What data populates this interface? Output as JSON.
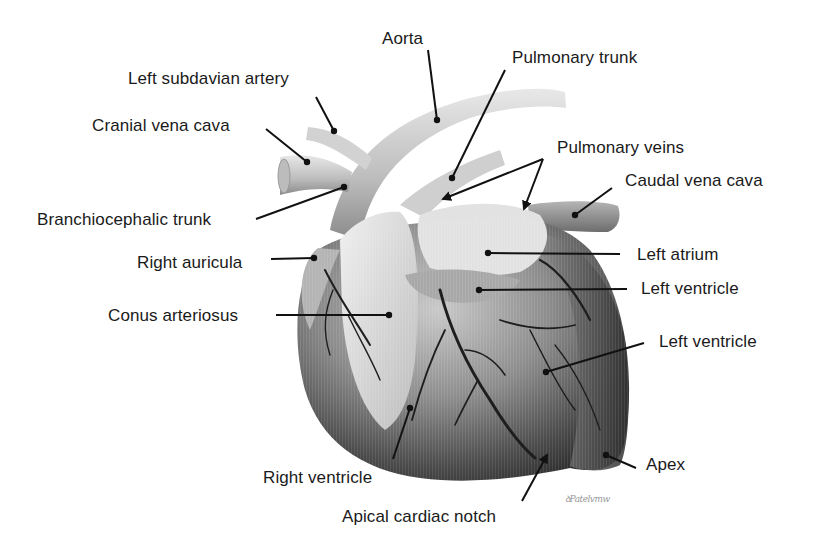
{
  "figure": {
    "colors": {
      "background": "#ffffff",
      "text": "#1a1a1a",
      "leader": "#111111"
    },
    "signature": "ꝺPatelvmw"
  },
  "labels": [
    {
      "id": "aorta",
      "text": "Aorta",
      "x": 382,
      "y": 30,
      "align": "left",
      "line": [
        [
          428,
          50
        ],
        [
          437,
          120
        ]
      ],
      "dot": true
    },
    {
      "id": "pulmonary-trunk",
      "text": "Pulmonary trunk",
      "x": 512,
      "y": 49,
      "align": "left",
      "line": [
        [
          505,
          70
        ],
        [
          452,
          178
        ]
      ],
      "dot": true
    },
    {
      "id": "left-subclavian-artery",
      "text": "Left subdavian artery",
      "x": 128,
      "y": 70,
      "align": "left",
      "line": [
        [
          316,
          97
        ],
        [
          334,
          131
        ]
      ],
      "dot": true
    },
    {
      "id": "cranial-vena-cava",
      "text": "Cranial vena cava",
      "x": 92,
      "y": 117,
      "align": "left",
      "line": [
        [
          266,
          129
        ],
        [
          307,
          162
        ]
      ],
      "dot": true
    },
    {
      "id": "pulmonary-veins",
      "text": "Pulmonary veins",
      "x": 557,
      "y": 139,
      "align": "left",
      "line": [
        [
          543,
          159
        ],
        [
          443,
          199
        ]
      ],
      "line2": [
        [
          543,
          159
        ],
        [
          524,
          209
        ]
      ],
      "arrow": true
    },
    {
      "id": "caudal-vena-cava",
      "text": "Caudal vena cava",
      "x": 625,
      "y": 172,
      "align": "left",
      "line": [
        [
          612,
          188
        ],
        [
          575,
          215
        ]
      ],
      "dot": true
    },
    {
      "id": "branchiocephalic-trunk",
      "text": "Branchiocephalic trunk",
      "x": 37,
      "y": 211,
      "align": "left",
      "line": [
        [
          256,
          219
        ],
        [
          344,
          187
        ]
      ],
      "dot": true
    },
    {
      "id": "left-atrium",
      "text": "Left atrium",
      "x": 637,
      "y": 246,
      "align": "left",
      "line": [
        [
          620,
          254
        ],
        [
          488,
          253
        ]
      ],
      "dot": true
    },
    {
      "id": "right-auricula",
      "text": "Right auricula",
      "x": 137,
      "y": 254,
      "align": "left",
      "line": [
        [
          271,
          259
        ],
        [
          314,
          258
        ]
      ],
      "dot": true
    },
    {
      "id": "left-ventricle-upper",
      "text": "Left ventricle",
      "x": 641,
      "y": 280,
      "align": "left",
      "line": [
        [
          627,
          289
        ],
        [
          479,
          290
        ]
      ],
      "dot": true
    },
    {
      "id": "conus-arteriosus",
      "text": "Conus arteriosus",
      "x": 108,
      "y": 307,
      "align": "left",
      "line": [
        [
          276,
          315
        ],
        [
          389,
          315
        ]
      ],
      "dot": true
    },
    {
      "id": "left-ventricle-lower",
      "text": "Left ventricle",
      "x": 659,
      "y": 333,
      "align": "left",
      "line": [
        [
          644,
          343
        ],
        [
          546,
          372
        ]
      ],
      "dot": true
    },
    {
      "id": "right-ventricle",
      "text": "Right ventricle",
      "x": 263,
      "y": 469,
      "align": "left",
      "line": [
        [
          393,
          459
        ],
        [
          410,
          408
        ]
      ],
      "dot": true
    },
    {
      "id": "apex",
      "text": "Apex",
      "x": 646,
      "y": 456,
      "align": "left",
      "line": [
        [
          636,
          468
        ],
        [
          606,
          455
        ]
      ],
      "dot": true
    },
    {
      "id": "apical-cardiac-notch",
      "text": "Apical cardiac notch",
      "x": 342,
      "y": 508,
      "align": "left",
      "line": [
        [
          522,
          501
        ],
        [
          547,
          455
        ]
      ],
      "arrowEnd": true
    }
  ]
}
